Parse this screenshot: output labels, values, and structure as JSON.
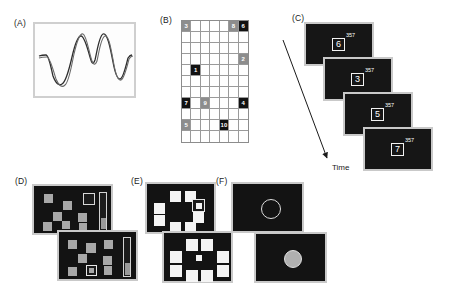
{
  "figure": {
    "panels": [
      {
        "id": "A",
        "label": "(A)",
        "caption_text": "(A)"
      },
      {
        "id": "B",
        "label": "(B)",
        "caption_text": "(B)"
      },
      {
        "id": "C",
        "label": "(C)",
        "caption_text": "(C)"
      },
      {
        "id": "D",
        "label": "(D)",
        "caption_text": "(D)"
      },
      {
        "id": "E",
        "label": "(E)",
        "caption_text": "(E)"
      },
      {
        "id": "F",
        "label": "(F)",
        "caption_text": "(F)"
      }
    ]
  },
  "panelA": {
    "label": "(A)",
    "type": "waveform-plot",
    "series": [
      {
        "name": "trace-1",
        "color": "#2b2b2b"
      },
      {
        "name": "trace-2",
        "color": "#555555"
      }
    ]
  },
  "panelB": {
    "label": "(B)",
    "columns": 7,
    "rows": 11,
    "tokens": [
      {
        "value": "3",
        "row": 1,
        "col": 1,
        "shade": "mid"
      },
      {
        "value": "8",
        "row": 1,
        "col": 6,
        "shade": "mid"
      },
      {
        "value": "6",
        "row": 1,
        "col": 7,
        "shade": "dark"
      },
      {
        "value": "2",
        "row": 4,
        "col": 7,
        "shade": "mid"
      },
      {
        "value": "1",
        "row": 5,
        "col": 2,
        "shade": "dark"
      },
      {
        "value": "7",
        "row": 8,
        "col": 1,
        "shade": "dark"
      },
      {
        "value": "9",
        "row": 8,
        "col": 3,
        "shade": "mid"
      },
      {
        "value": "4",
        "row": 8,
        "col": 7,
        "shade": "dark"
      },
      {
        "value": "5",
        "row": 10,
        "col": 1,
        "shade": "mid"
      },
      {
        "value": "10",
        "row": 10,
        "col": 5,
        "shade": "dark"
      }
    ]
  },
  "panelC": {
    "label": "(C)",
    "time_label": "Time",
    "screens": [
      {
        "digit": "6",
        "superscript": "357"
      },
      {
        "digit": "3",
        "superscript": "357"
      },
      {
        "digit": "5",
        "superscript": "357"
      },
      {
        "digit": "7",
        "superscript": "357"
      }
    ]
  },
  "panelD": {
    "label": "(D)",
    "screens": [
      {
        "name": "upper",
        "squares": 8,
        "target": "outlined-square",
        "scale_bar": true
      },
      {
        "name": "lower",
        "squares": 8,
        "target": "outlined-square",
        "scale_bar": true
      }
    ]
  },
  "panelE": {
    "label": "(E)",
    "screens": [
      {
        "name": "upper",
        "squares": 8,
        "target": "highlighted-square"
      },
      {
        "name": "lower",
        "squares": 8,
        "target": "center-dot"
      }
    ]
  },
  "panelF": {
    "label": "(F)",
    "screens": [
      {
        "name": "upper",
        "stimulus": "circle-outline"
      },
      {
        "name": "lower",
        "stimulus": "filled-circle"
      }
    ]
  },
  "colors": {
    "background": "#ffffff",
    "screen_fill": "#131313",
    "screen_border": "#c9c9c9",
    "square_gray": "#a8a8a8",
    "square_white": "#f4f4f4",
    "token_dark": "#121212",
    "token_mid": "#8d8d8d",
    "text": "#1a1a1a"
  }
}
